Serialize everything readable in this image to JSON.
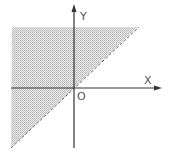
{
  "diagram": {
    "inequality": "y > x",
    "boundary": {
      "equation": "y = x",
      "style": "dashed",
      "included": false
    },
    "shaded_region": "above line",
    "axes": {
      "x_label": "X",
      "y_label": "Y",
      "origin_label": "O"
    },
    "colors": {
      "shade": "#d4d4d4",
      "axis": "#333333",
      "boundary": "#666666",
      "text": "#555555"
    }
  }
}
